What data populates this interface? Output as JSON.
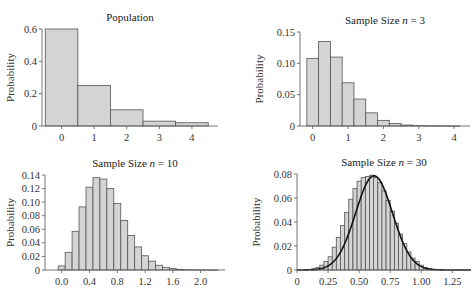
{
  "chart_data": [
    {
      "type": "bar",
      "title": "Population",
      "xlabel": "",
      "ylabel": "Probability",
      "xticks": [
        "0",
        "1",
        "2",
        "3",
        "4"
      ],
      "yticks": [
        "0",
        "0.2",
        "0.4",
        "0.6"
      ],
      "ylim": [
        0,
        0.6
      ],
      "xlim": [
        -0.6,
        4.8
      ],
      "bin_width": 1,
      "categories": [
        0,
        1,
        2,
        3,
        4
      ],
      "values": [
        0.6,
        0.25,
        0.1,
        0.03,
        0.02
      ],
      "grid": false,
      "frame": {
        "x": 42,
        "y": 29,
        "w": 176,
        "h": 97
      }
    },
    {
      "type": "bar",
      "title": "Sample Size n = 3",
      "title_parts": [
        "Sample Size ",
        "n",
        " = 3"
      ],
      "xlabel": "",
      "ylabel": "Probability",
      "xticks": [
        "0",
        "1",
        "2",
        "3",
        "4"
      ],
      "yticks": [
        "0",
        "0.05",
        "0.10",
        "0.15"
      ],
      "ylim": [
        0,
        0.15
      ],
      "xlim": [
        -0.36,
        4.45
      ],
      "bin_width": 0.3333,
      "categories": [
        0,
        0.333,
        0.667,
        1,
        1.333,
        1.667,
        2,
        2.333,
        2.667,
        3,
        3.333,
        3.667,
        4
      ],
      "values": [
        0.108,
        0.135,
        0.11,
        0.069,
        0.043,
        0.021,
        0.009,
        0.004,
        0.0015,
        0.0006,
        0.0003,
        0.0002,
        0.0001
      ],
      "grid": false,
      "frame": {
        "x": 300,
        "y": 32,
        "w": 170,
        "h": 94
      }
    },
    {
      "type": "bar",
      "title": "Sample Size n = 10",
      "title_parts": [
        "Sample Size ",
        "n",
        " = 10"
      ],
      "xlabel": "",
      "ylabel": "Probability",
      "xticks": [
        "0.0",
        "0.4",
        "0.8",
        "1.2",
        "1.6",
        "2.0"
      ],
      "yticks": [
        "0",
        "0.02",
        "0.04",
        "0.06",
        "0.08",
        "0.10",
        "0.12",
        "0.14"
      ],
      "ylim": [
        0,
        0.14
      ],
      "xlim": [
        -0.24,
        2.35
      ],
      "bin_width": 0.1,
      "categories": [
        0.0,
        0.1,
        0.2,
        0.3,
        0.4,
        0.5,
        0.6,
        0.7,
        0.8,
        0.9,
        1.0,
        1.1,
        1.2,
        1.3,
        1.4,
        1.5,
        1.6,
        1.7,
        1.8,
        1.9,
        2.0,
        2.1,
        2.2
      ],
      "values": [
        0.006,
        0.026,
        0.057,
        0.093,
        0.122,
        0.136,
        0.134,
        0.12,
        0.098,
        0.073,
        0.051,
        0.034,
        0.021,
        0.013,
        0.007,
        0.004,
        0.002,
        0.001,
        0.0005,
        0.0003,
        0.0002,
        0.0001,
        0.0001
      ],
      "grid": false,
      "frame": {
        "x": 45,
        "y": 175,
        "w": 180,
        "h": 95
      }
    },
    {
      "type": "bar",
      "title": "Sample Size n = 30",
      "title_parts": [
        "Sample Size ",
        "n",
        " = 30"
      ],
      "xlabel": "",
      "ylabel": "Probability",
      "xticks": [
        "0",
        "0.25",
        "0.50",
        "0.75",
        "1.00",
        "1.25"
      ],
      "yticks": [
        "0",
        "0.02",
        "0.04",
        "0.06",
        "0.08"
      ],
      "ylim": [
        0,
        0.08
      ],
      "xlim": [
        0,
        1.4
      ],
      "bin_width": 0.0333,
      "categories": [
        0.133,
        0.167,
        0.2,
        0.233,
        0.267,
        0.3,
        0.333,
        0.367,
        0.4,
        0.433,
        0.467,
        0.5,
        0.533,
        0.567,
        0.6,
        0.633,
        0.667,
        0.7,
        0.733,
        0.767,
        0.8,
        0.833,
        0.867,
        0.9,
        0.933,
        0.967,
        1.0,
        1.033,
        1.067,
        1.1
      ],
      "values": [
        0.001,
        0.002,
        0.004,
        0.007,
        0.011,
        0.019,
        0.027,
        0.037,
        0.048,
        0.059,
        0.068,
        0.074,
        0.077,
        0.078,
        0.079,
        0.077,
        0.073,
        0.066,
        0.058,
        0.049,
        0.039,
        0.03,
        0.022,
        0.015,
        0.01,
        0.007,
        0.004,
        0.002,
        0.001,
        0.0005
      ],
      "overlay": {
        "type": "normal_curve",
        "mean": 0.62,
        "peak": 0.0785,
        "sd": 0.148
      },
      "grid": false,
      "frame": {
        "x": 297,
        "y": 174,
        "w": 174,
        "h": 96
      }
    }
  ]
}
